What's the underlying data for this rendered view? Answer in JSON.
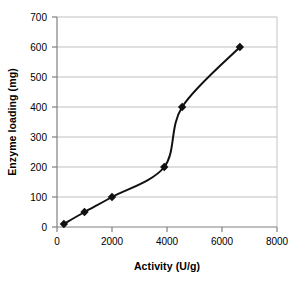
{
  "chart_data": {
    "type": "line",
    "title": "",
    "xlabel": "Activity (U/g)",
    "ylabel": "Enzyme loading (mg)",
    "xlim": [
      0,
      8000
    ],
    "ylim": [
      0,
      700
    ],
    "xticks": [
      0,
      2000,
      4000,
      6000,
      8000
    ],
    "yticks": [
      0,
      100,
      200,
      300,
      400,
      500,
      600,
      700
    ],
    "xtick_labels": [
      "0",
      "2000",
      "4000",
      "6000",
      "8000"
    ],
    "ytick_labels": [
      "0",
      "100",
      "200",
      "300",
      "400",
      "500",
      "600",
      "700"
    ],
    "grid": "horizontal",
    "legend": "none",
    "marker": "diamond",
    "marker_color": "#111111",
    "line_color": "#111111",
    "line_width": 2,
    "smoothing": "spline",
    "series": [
      {
        "name": "Enzyme loading vs Activity",
        "x": [
          250,
          1000,
          2000,
          3900,
          4550,
          6650
        ],
        "y": [
          10,
          50,
          100,
          200,
          400,
          600
        ]
      }
    ],
    "points": [
      {
        "x": 250,
        "y": 10
      },
      {
        "x": 1000,
        "y": 50
      },
      {
        "x": 2000,
        "y": 100
      },
      {
        "x": 3900,
        "y": 200
      },
      {
        "x": 4550,
        "y": 400
      },
      {
        "x": 6650,
        "y": 600
      }
    ],
    "colors": {
      "background": "#ffffff",
      "grid": "#bfbfbf",
      "axis": "#808080",
      "text": "#000000",
      "data": "#111111"
    }
  }
}
